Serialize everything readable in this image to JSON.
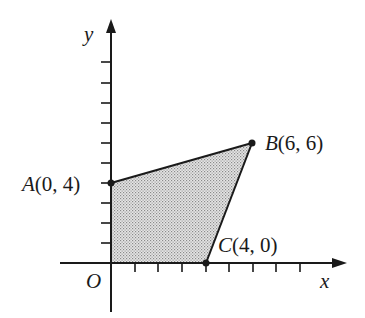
{
  "diagram": {
    "type": "coordinate-plane-polygon",
    "axes": {
      "x_label": "x",
      "y_label": "y",
      "origin_label": "O",
      "x_ticks": 8,
      "y_ticks": 10
    },
    "points": [
      {
        "name": "A",
        "coords": "(0, 4)",
        "x": 0,
        "y": 4
      },
      {
        "name": "B",
        "coords": "(6, 6)",
        "x": 6,
        "y": 6
      },
      {
        "name": "C",
        "coords": "(4, 0)",
        "x": 4,
        "y": 0
      },
      {
        "name": "O",
        "x": 0,
        "y": 0
      }
    ],
    "region": {
      "vertices": [
        "O",
        "A",
        "B",
        "C"
      ],
      "fill": "#bdbdbd",
      "stroke": "#1a1a1a"
    }
  }
}
